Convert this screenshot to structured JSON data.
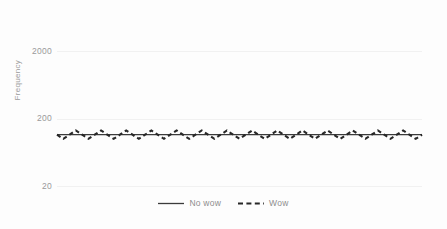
{
  "chart_data": {
    "type": "line",
    "title": "",
    "subtitle": "",
    "xlabel": "",
    "ylabel": "Frequency",
    "yscale": "log",
    "ylim": [
      20,
      2000
    ],
    "y_ticks": [
      2000,
      200,
      20
    ],
    "y_tick_labels": [
      "2000",
      "200",
      "20"
    ],
    "x_ticks": [],
    "x_tick_labels": [],
    "grid": true,
    "grid_axis": "y",
    "legend_position": "bottom-center",
    "legend": [
      "No wow",
      "Wow"
    ],
    "x": [
      0,
      1,
      2,
      3,
      4,
      5,
      6,
      7,
      8,
      9,
      10,
      11,
      12,
      13,
      14,
      15,
      16,
      17,
      18,
      19,
      20,
      21,
      22,
      23,
      24,
      25,
      26,
      27,
      28,
      29,
      30,
      31,
      32,
      33,
      34,
      35,
      36,
      37,
      38,
      39,
      40,
      41,
      42,
      43,
      44,
      45,
      46,
      47,
      48,
      49,
      50,
      51,
      52,
      53,
      54,
      55,
      56,
      57,
      58
    ],
    "series": [
      {
        "name": "No wow",
        "style": "solid",
        "color": "#3b3b3b",
        "width": 1.2,
        "values": [
          115,
          115,
          115,
          115,
          115,
          115,
          115,
          115,
          115,
          115,
          115,
          115,
          115,
          115,
          115,
          115,
          115,
          115,
          115,
          115,
          115,
          115,
          115,
          115,
          115,
          115,
          115,
          115,
          115,
          115,
          115,
          115,
          115,
          115,
          115,
          115,
          115,
          115,
          115,
          115,
          115,
          115,
          115,
          115,
          115,
          115,
          115,
          115,
          115,
          115,
          115,
          115,
          115,
          115,
          115,
          115,
          115,
          115,
          115
        ]
      },
      {
        "name": "Wow",
        "style": "dashed",
        "color": "#272727",
        "width": 2.1,
        "values": [
          115,
          100,
          115,
          133,
          115,
          100,
          115,
          133,
          115,
          100,
          115,
          133,
          115,
          100,
          115,
          133,
          115,
          100,
          115,
          133,
          115,
          100,
          115,
          133,
          115,
          100,
          115,
          133,
          115,
          100,
          115,
          133,
          115,
          100,
          115,
          133,
          115,
          100,
          115,
          133,
          115,
          100,
          115,
          133,
          115,
          100,
          115,
          133,
          115,
          100,
          115,
          133,
          115,
          100,
          115,
          133,
          115,
          100,
          115
        ]
      }
    ],
    "annotations": []
  },
  "axes": {
    "y_title": "Frequency",
    "y_tick_labels": [
      "2000",
      "200",
      "20"
    ]
  },
  "legend": {
    "entries": [
      {
        "label": "No wow",
        "style": "solid"
      },
      {
        "label": "Wow",
        "style": "dashed"
      }
    ]
  },
  "colors": {
    "background": "#fdfdfd",
    "grid": "#f1f1f1",
    "axis_text": "#9a9a9a",
    "legend_text": "#8d8d8d",
    "series_no_wow": "#3b3b3b",
    "series_wow": "#272727"
  }
}
